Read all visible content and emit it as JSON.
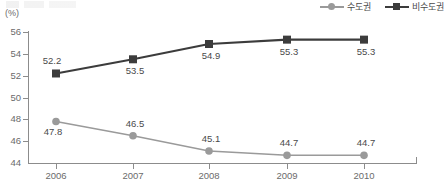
{
  "chart_data": {
    "type": "line",
    "title": "",
    "xlabel": "",
    "ylabel": "",
    "unit_label": "(%)",
    "categories": [
      "2006",
      "2007",
      "2008",
      "2009",
      "2010"
    ],
    "ylim": [
      44,
      56
    ],
    "yticks": [
      44,
      46,
      48,
      50,
      52,
      54,
      56
    ],
    "ytick_labels": [
      "44",
      "46",
      "48",
      "50",
      "52",
      "54",
      "56"
    ],
    "grid": false,
    "legend_position": "top-right",
    "series": [
      {
        "name": "수도권",
        "values": [
          47.8,
          46.5,
          45.1,
          44.7,
          44.7
        ],
        "value_labels": [
          "47.8",
          "46.5",
          "45.1",
          "44.7",
          "44.7"
        ],
        "color": "#9a9a9a",
        "marker": "circle"
      },
      {
        "name": "비수도권",
        "values": [
          52.2,
          53.5,
          54.9,
          55.3,
          55.3
        ],
        "value_labels": [
          "52.2",
          "53.5",
          "54.9",
          "55.3",
          "55.3"
        ],
        "color": "#3c3c3c",
        "marker": "square"
      }
    ]
  },
  "legend": {
    "items": [
      {
        "label": "수도권",
        "color": "#9a9a9a",
        "marker": "circle"
      },
      {
        "label": "비수도권",
        "color": "#3c3c3c",
        "marker": "square"
      }
    ]
  },
  "axes": {
    "unit": "(%)",
    "axis_color": "#8c8c8c"
  }
}
